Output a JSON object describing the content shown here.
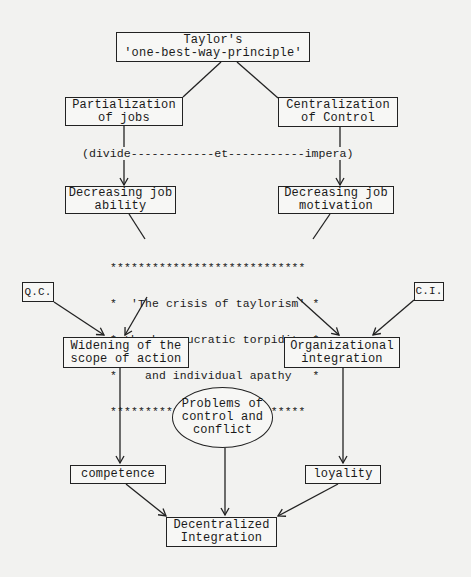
{
  "diagram": {
    "top": {
      "line1": "Taylor's",
      "line2": "'one-best-way-principle'"
    },
    "partialization": {
      "line1": "Partialization",
      "line2": "of jobs"
    },
    "centralization": {
      "line1": "Centralization",
      "line2": "of Control"
    },
    "divide_line": "(divide------------et-----------impera)",
    "ability": {
      "line1": "Decreasing job",
      "line2": "ability"
    },
    "motivation": {
      "line1": "Decreasing job",
      "line2": "motivation"
    },
    "crisis": {
      "border_top": "****************************",
      "line1": "*  'The crisis of taylorism' *",
      "line2": "* the bureaucratic torpidity *",
      "line3": "*    and individual apathy   *",
      "border_bottom": "****************************"
    },
    "qc": "Q.C.",
    "ci": "C.I.",
    "widening": {
      "line1": "Widening of the",
      "line2": "scope of action"
    },
    "organizational": {
      "line1": "Organizational",
      "line2": "integration"
    },
    "problems": {
      "line1": "Problems of",
      "line2": "control and",
      "line3": "conflict"
    },
    "competence": "competence",
    "loyality": "loyality",
    "decentralized": {
      "line1": "Decentralized",
      "line2": "Integration"
    }
  }
}
